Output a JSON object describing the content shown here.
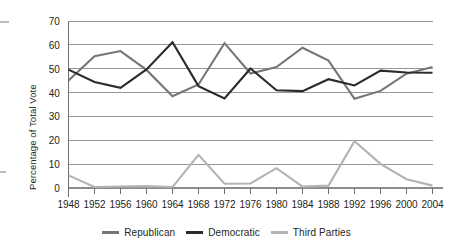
{
  "chart_data": {
    "type": "line",
    "title": "",
    "xlabel": "",
    "ylabel": "Percentage of Total Vote",
    "x": [
      1948,
      1952,
      1956,
      1960,
      1964,
      1968,
      1972,
      1976,
      1980,
      1984,
      1988,
      1992,
      1996,
      2000,
      2004
    ],
    "categories": [
      "1948",
      "1952",
      "1956",
      "1960",
      "1964",
      "1968",
      "1972",
      "1976",
      "1980",
      "1984",
      "1988",
      "1992",
      "1996",
      "2000",
      "2004"
    ],
    "ylim": [
      0,
      70
    ],
    "yticks": [
      0,
      10,
      20,
      30,
      40,
      50,
      60,
      70
    ],
    "ytick_labels": [
      "0",
      "10",
      "20",
      "30",
      "40",
      "50",
      "60",
      "70"
    ],
    "grid": true,
    "legend_position": "bottom",
    "series": [
      {
        "name": "Republican",
        "color": "#767676",
        "values": [
          45.1,
          55.2,
          57.4,
          49.5,
          38.5,
          43.4,
          60.7,
          48.0,
          50.7,
          58.8,
          53.4,
          37.4,
          40.7,
          47.9,
          50.7
        ]
      },
      {
        "name": "Democratic",
        "color": "#2b2b2b",
        "values": [
          49.6,
          44.4,
          42.0,
          49.7,
          61.1,
          42.7,
          37.5,
          50.1,
          41.0,
          40.6,
          45.6,
          43.0,
          49.2,
          48.4,
          48.3
        ]
      },
      {
        "name": "Third Parties",
        "color": "#b3b3b3",
        "values": [
          5.3,
          0.4,
          0.6,
          0.8,
          0.4,
          13.9,
          1.8,
          1.9,
          8.3,
          0.6,
          1.0,
          19.6,
          10.1,
          3.7,
          1.0
        ]
      }
    ]
  },
  "legend": {
    "items": [
      {
        "label": "Republican",
        "color": "#767676"
      },
      {
        "label": "Democratic",
        "color": "#2b2b2b"
      },
      {
        "label": "Third Parties",
        "color": "#b3b3b3"
      }
    ]
  },
  "axes": {
    "y_title": "Percentage of Total Vote"
  }
}
